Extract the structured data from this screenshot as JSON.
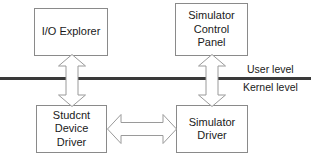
{
  "diagram": {
    "background_color": "#ffffff",
    "box_border_color": "#8a8a8a",
    "divider_color": "#3a3a3a",
    "arrow_stroke_color": "#9a9a9a",
    "arrow_fill_color": "#ffffff",
    "text_color": "#1a1a1a",
    "nodes": [
      {
        "id": "io-explorer",
        "label": "I/O Explorer",
        "level": "user"
      },
      {
        "id": "simulator-control-panel",
        "label": "Simulator\nControl\nPanel",
        "level": "user"
      },
      {
        "id": "student-device-driver",
        "label": "Studcnt\nDevice\nDriver",
        "level": "kernel"
      },
      {
        "id": "simulator-driver",
        "label": "Simulator\nDriver",
        "level": "kernel"
      }
    ],
    "levels": {
      "user_label": "User level",
      "kernel_label": "Kernel level"
    },
    "connectors": [
      {
        "id": "io-explorer-to-student-device-driver",
        "from": "io-explorer",
        "to": "student-device-driver",
        "orientation": "vertical",
        "arrowheads": "both"
      },
      {
        "id": "simulator-control-panel-to-simulator-driver",
        "from": "simulator-control-panel",
        "to": "simulator-driver",
        "orientation": "vertical",
        "arrowheads": "both"
      },
      {
        "id": "student-device-driver-to-simulator-driver",
        "from": "student-device-driver",
        "to": "simulator-driver",
        "orientation": "horizontal",
        "arrowheads": "both"
      }
    ]
  }
}
